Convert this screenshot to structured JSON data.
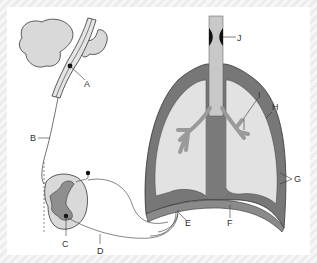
{
  "diagram": {
    "colors": {
      "frame_bg": "#f2f2f2",
      "panel_bg": "#ffffff",
      "tissue_light": "#d9d9d9",
      "tissue_mid": "#a6a6a6",
      "tissue_dark": "#777777",
      "outline": "#333333",
      "airway_fill": "#c8c8c8",
      "vocal_fold": "#111111"
    },
    "labels": [
      {
        "id": "A",
        "text": "A",
        "points_to": "respiratory centre in brainstem (medulla)"
      },
      {
        "id": "B",
        "text": "B",
        "points_to": "descending spinal tract"
      },
      {
        "id": "C",
        "text": "C",
        "points_to": "motor neuron in spinal cord grey matter"
      },
      {
        "id": "D",
        "text": "D",
        "points_to": "phrenic nerve"
      },
      {
        "id": "E",
        "text": "E",
        "points_to": "nerve ending at diaphragm"
      },
      {
        "id": "F",
        "text": "F",
        "points_to": "diaphragm"
      },
      {
        "id": "G",
        "text": "G",
        "points_to": "pleural membranes"
      },
      {
        "id": "H",
        "text": "H",
        "points_to": "chest wall / pleura"
      },
      {
        "id": "I",
        "text": "I",
        "points_to": "bronchiole"
      },
      {
        "id": "J",
        "text": "J",
        "points_to": "larynx / vocal folds"
      }
    ]
  }
}
